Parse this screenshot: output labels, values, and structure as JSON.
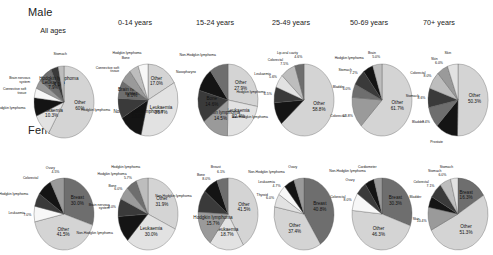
{
  "figure": {
    "row_labels": [
      "Male",
      "Female"
    ],
    "column_headers": [
      "All ages",
      "0-14 years",
      "15-24 years",
      "25-49 years",
      "50-69 years",
      "70+ years"
    ]
  },
  "colors": {
    "other": "#d4d4d4",
    "light": "#e2e2e2",
    "mid_light": "#bdbdbd",
    "mid": "#9a9a9a",
    "mid_dark": "#6e6e6e",
    "dark": "#3a3a3a",
    "black": "#141414",
    "white": "#f7f7f7",
    "outline": "#555555"
  },
  "chart_data": [
    {
      "type": "pie",
      "title": "Male - All ages",
      "sex": "Male",
      "age_group": "All ages",
      "labels": [
        "Other",
        "Leukaemia",
        "Non-Hodgkin lymphoma",
        "Connective soft tissue",
        "Brain nervous system",
        "Leukaemia",
        "Hodgkin lymphoma",
        "Stomach",
        "Hodgkin lymphoma"
      ],
      "slices": [
        {
          "label": "Other",
          "value": 60.0,
          "value_label": "60%",
          "color": "#d4d4d4",
          "inside": true
        },
        {
          "label": "Leukaemia",
          "value": 10.3,
          "value_label": "10.3%",
          "color": "#e2e2e2",
          "inside": true
        },
        {
          "label": "Non-Hodgkin lymphoma",
          "value": 8.5,
          "value_label": "",
          "color": "#141414",
          "inside": false
        },
        {
          "label": "Connective soft tissue",
          "value": 4.5,
          "value_label": "",
          "color": "#f7f7f7",
          "inside": false
        },
        {
          "label": "Brain nervous system",
          "value": 4.0,
          "value_label": "",
          "color": "#9a9a9a",
          "inside": false
        },
        {
          "label": "Leukaemia",
          "value": 7.9,
          "value_label": "7.9%",
          "color": "#6e6e6e",
          "inside": true
        },
        {
          "label": "Hodgkin lymphoma",
          "value": 4.1,
          "value_label": "4.1%",
          "color": "#3a3a3a",
          "inside": true
        },
        {
          "label": "Stomach",
          "value": 3.2,
          "value_label": "",
          "color": "#bdbdbd",
          "inside": false
        }
      ]
    },
    {
      "type": "pie",
      "title": "Male - 0-14 years",
      "sex": "Male",
      "age_group": "0-14 years",
      "slices": [
        {
          "label": "Other",
          "value": 17.0,
          "value_label": "17.0%",
          "color": "#d4d4d4",
          "inside": true
        },
        {
          "label": "Leukaemia",
          "value": 36.7,
          "value_label": "36.7%",
          "color": "#e2e2e2",
          "inside": true
        },
        {
          "label": "Non-Hodgkin lymphoma",
          "value": 13.0,
          "value_label": "13.0%",
          "color": "#141414",
          "inside": true
        },
        {
          "label": "Hodgkin lymphoma",
          "value": 9.0,
          "value_label": "",
          "color": "#3a3a3a",
          "inside": false
        },
        {
          "label": "Brain nervous system",
          "value": 8.0,
          "value_label": "8.0%",
          "color": "#6e6e6e",
          "inside": true
        },
        {
          "label": "Connective soft tissue",
          "value": 6.0,
          "value_label": "",
          "color": "#9a9a9a",
          "inside": false
        },
        {
          "label": "Bone",
          "value": 5.0,
          "value_label": "",
          "color": "#bdbdbd",
          "inside": false
        },
        {
          "label": "Hodgkin lymphoma",
          "value": 5.3,
          "value_label": "",
          "color": "#f7f7f7",
          "inside": false
        }
      ]
    },
    {
      "type": "pie",
      "title": "Male - 15-24 years",
      "sex": "Male",
      "age_group": "15-24 years",
      "slices": [
        {
          "label": "Other",
          "value": 27.9,
          "value_label": "27.9%",
          "color": "#d4d4d4",
          "inside": true
        },
        {
          "label": "Leukaemia",
          "value": 22.4,
          "value_label": "22.4%",
          "color": "#e2e2e2",
          "inside": true
        },
        {
          "label": "Hodgkin lymphoma",
          "value": 14.5,
          "value_label": "14.5%",
          "color": "#9a9a9a",
          "inside": true
        },
        {
          "label": "Bone",
          "value": 14.6,
          "value_label": "14.6%",
          "color": "#3a3a3a",
          "inside": true
        },
        {
          "label": "Nasopharynx",
          "value": 10.6,
          "value_label": "",
          "color": "#141414",
          "inside": false
        },
        {
          "label": "Non-Hodgkin lymphoma",
          "value": 10.0,
          "value_label": "",
          "color": "#6e6e6e",
          "inside": false
        }
      ]
    },
    {
      "type": "pie",
      "title": "Male - 25-49 years",
      "sex": "Male",
      "age_group": "25-49 years",
      "slices": [
        {
          "label": "Other",
          "value": 58.8,
          "value_label": "58.8%",
          "color": "#d4d4d4",
          "inside": true
        },
        {
          "label": "Non-Hodgkin lymphoma",
          "value": 9.5,
          "value_label": "",
          "color": "#141414",
          "inside": false
        },
        {
          "label": "Hodgkin lymphoma",
          "value": 6.5,
          "value_label": "6.5%",
          "color": "#3a3a3a",
          "inside": false
        },
        {
          "label": "Leukaemia",
          "value": 5.6,
          "value_label": "5.6%",
          "color": "#e2e2e2",
          "inside": false
        },
        {
          "label": "Colorectal",
          "value": 7.5,
          "value_label": "7.5%",
          "color": "#bdbdbd",
          "inside": false
        },
        {
          "label": "Lip-oral cavity",
          "value": 4.6,
          "value_label": "4.6%",
          "color": "#6e6e6e",
          "inside": false
        }
      ]
    },
    {
      "type": "pie",
      "title": "Male - 50-69 years",
      "sex": "Male",
      "age_group": "50-69 years",
      "slices": [
        {
          "label": "Other",
          "value": 61.7,
          "value_label": "61.7%",
          "color": "#d4d4d4",
          "inside": true
        },
        {
          "label": "Colorectal",
          "value": 13.8,
          "value_label": "13.8%",
          "color": "#9a9a9a",
          "inside": false
        },
        {
          "label": "Bladder",
          "value": 6.0,
          "value_label": "6.0%",
          "color": "#6e6e6e",
          "inside": false
        },
        {
          "label": "Stomach",
          "value": 7.2,
          "value_label": "7.2%",
          "color": "#3a3a3a",
          "inside": false
        },
        {
          "label": "Hodgkin lymphoma",
          "value": 5.4,
          "value_label": "",
          "color": "#141414",
          "inside": false
        },
        {
          "label": "Brain",
          "value": 5.0,
          "value_label": "5.0%",
          "color": "#bdbdbd",
          "inside": false
        }
      ]
    },
    {
      "type": "pie",
      "title": "Male - 70+ years",
      "sex": "Male",
      "age_group": "70+ years",
      "slices": [
        {
          "label": "Other",
          "value": 50.3,
          "value_label": "50.3%",
          "color": "#d4d4d4",
          "inside": true
        },
        {
          "label": "Prostate",
          "value": 12.0,
          "value_label": "",
          "color": "#141414",
          "inside": false
        },
        {
          "label": "Bladder",
          "value": 9.4,
          "value_label": "9.4%",
          "color": "#6e6e6e",
          "inside": false
        },
        {
          "label": "Stomach",
          "value": 8.6,
          "value_label": "8.6%",
          "color": "#3a3a3a",
          "inside": false
        },
        {
          "label": "Colorectal",
          "value": 8.0,
          "value_label": "8.0%",
          "color": "#bdbdbd",
          "inside": false
        },
        {
          "label": "Skin",
          "value": 6.0,
          "value_label": "6.0%",
          "color": "#9a9a9a",
          "inside": false
        },
        {
          "label": "Skin",
          "value": 5.7,
          "value_label": "",
          "color": "#e2e2e2",
          "inside": false
        }
      ]
    },
    {
      "type": "pie",
      "title": "Female - All ages",
      "sex": "Female",
      "age_group": "All ages",
      "slices": [
        {
          "label": "Breast",
          "value": 30.0,
          "value_label": "30.0%",
          "color": "#6e6e6e",
          "inside": true
        },
        {
          "label": "Other",
          "value": 41.5,
          "value_label": "41.5%",
          "color": "#d4d4d4",
          "inside": true
        },
        {
          "label": "Leukaemia",
          "value": 7.0,
          "value_label": "7.0%",
          "color": "#f7f7f7",
          "inside": false
        },
        {
          "label": "Non-Hodgkin lymphoma",
          "value": 6.0,
          "value_label": "",
          "color": "#3a3a3a",
          "inside": false
        },
        {
          "label": "Colorectal",
          "value": 8.0,
          "value_label": "",
          "color": "#141414",
          "inside": false
        },
        {
          "label": "Ovary",
          "value": 7.5,
          "value_label": "4.5%",
          "color": "#9a9a9a",
          "inside": false
        }
      ]
    },
    {
      "type": "pie",
      "title": "Female - 0-14 years",
      "sex": "Female",
      "age_group": "0-14 years",
      "slices": [
        {
          "label": "Other",
          "value": 31.9,
          "value_label": "31.9%",
          "color": "#d4d4d4",
          "inside": true
        },
        {
          "label": "Leukaemia",
          "value": 30.0,
          "value_label": "30.0%",
          "color": "#e2e2e2",
          "inside": true
        },
        {
          "label": "Non-Hodgkin lymphoma",
          "value": 12.0,
          "value_label": "",
          "color": "#141414",
          "inside": false
        },
        {
          "label": "Brain nervous system",
          "value": 8.0,
          "value_label": "8.0%",
          "color": "#3a3a3a",
          "inside": false
        },
        {
          "label": "Bone",
          "value": 6.0,
          "value_label": "6.0%",
          "color": "#9a9a9a",
          "inside": false
        },
        {
          "label": "Hodgkin lymphoma",
          "value": 5.7,
          "value_label": "5.7%",
          "color": "#6e6e6e",
          "inside": false
        },
        {
          "label": "Hodgkin lymphoma",
          "value": 6.4,
          "value_label": "",
          "color": "#bdbdbd",
          "inside": false
        }
      ]
    },
    {
      "type": "pie",
      "title": "Female - 15-24 years",
      "sex": "Female",
      "age_group": "15-24 years",
      "slices": [
        {
          "label": "Other",
          "value": 41.5,
          "value_label": "41.5%",
          "color": "#d4d4d4",
          "inside": true
        },
        {
          "label": "Leukaemia",
          "value": 18.7,
          "value_label": "18.7%",
          "color": "#e2e2e2",
          "inside": true
        },
        {
          "label": "Hodgkin lymphoma",
          "value": 15.7,
          "value_label": "15.7%",
          "color": "#9a9a9a",
          "inside": true
        },
        {
          "label": "Non-Hodgkin lymphoma",
          "value": 10.0,
          "value_label": "",
          "color": "#3a3a3a",
          "inside": false
        },
        {
          "label": "Bone",
          "value": 8.0,
          "value_label": "8.0%",
          "color": "#141414",
          "inside": false
        },
        {
          "label": "Breast",
          "value": 6.1,
          "value_label": "6.1%",
          "color": "#6e6e6e",
          "inside": false
        }
      ]
    },
    {
      "type": "pie",
      "title": "Female - 25-49 years",
      "sex": "Female",
      "age_group": "25-49 years",
      "slices": [
        {
          "label": "Breast",
          "value": 40.8,
          "value_label": "40.8%",
          "color": "#6e6e6e",
          "inside": true
        },
        {
          "label": "Other",
          "value": 37.4,
          "value_label": "37.4%",
          "color": "#d4d4d4",
          "inside": true
        },
        {
          "label": "Thyroid",
          "value": 6.0,
          "value_label": "6.0%",
          "color": "#e2e2e2",
          "inside": false
        },
        {
          "label": "Leukaemia",
          "value": 4.7,
          "value_label": "4.7%",
          "color": "#f7f7f7",
          "inside": false
        },
        {
          "label": "Non-Hodgkin lymphoma",
          "value": 5.6,
          "value_label": "",
          "color": "#141414",
          "inside": false
        },
        {
          "label": "Ovary",
          "value": 5.5,
          "value_label": "",
          "color": "#9a9a9a",
          "inside": false
        }
      ]
    },
    {
      "type": "pie",
      "title": "Female - 50-69 years",
      "sex": "Female",
      "age_group": "50-69 years",
      "slices": [
        {
          "label": "Breast",
          "value": 30.3,
          "value_label": "30.3%",
          "color": "#6e6e6e",
          "inside": true
        },
        {
          "label": "Other",
          "value": 46.3,
          "value_label": "46.3%",
          "color": "#d4d4d4",
          "inside": true
        },
        {
          "label": "Colorectal",
          "value": 8.0,
          "value_label": "8.0%",
          "color": "#f7f7f7",
          "inside": false
        },
        {
          "label": "Ovary",
          "value": 6.0,
          "value_label": "",
          "color": "#3a3a3a",
          "inside": false
        },
        {
          "label": "Non-Hodgkin lymphoma",
          "value": 5.0,
          "value_label": "",
          "color": "#141414",
          "inside": false
        },
        {
          "label": "Cardiometer",
          "value": 4.4,
          "value_label": "",
          "color": "#9a9a9a",
          "inside": false
        }
      ]
    },
    {
      "type": "pie",
      "title": "Female - 70+ years",
      "sex": "Female",
      "age_group": "70+ years",
      "slices": [
        {
          "label": "Breast",
          "value": 16.3,
          "value_label": "16.3%",
          "color": "#6e6e6e",
          "inside": true
        },
        {
          "label": "Other",
          "value": 51.3,
          "value_label": "51.3%",
          "color": "#d4d4d4",
          "inside": true
        },
        {
          "label": "Skin",
          "value": 10.4,
          "value_label": "10.4%",
          "color": "#9a9a9a",
          "inside": false
        },
        {
          "label": "Bladder",
          "value": 5.0,
          "value_label": "",
          "color": "#141414",
          "inside": false
        },
        {
          "label": "Colorectal",
          "value": 7.0,
          "value_label": "7.1%",
          "color": "#3a3a3a",
          "inside": false
        },
        {
          "label": "Stomach",
          "value": 6.0,
          "value_label": "6.0%",
          "color": "#bdbdbd",
          "inside": false
        },
        {
          "label": "Stomach",
          "value": 4.0,
          "value_label": "",
          "color": "#e2e2e2",
          "inside": false
        }
      ]
    }
  ]
}
